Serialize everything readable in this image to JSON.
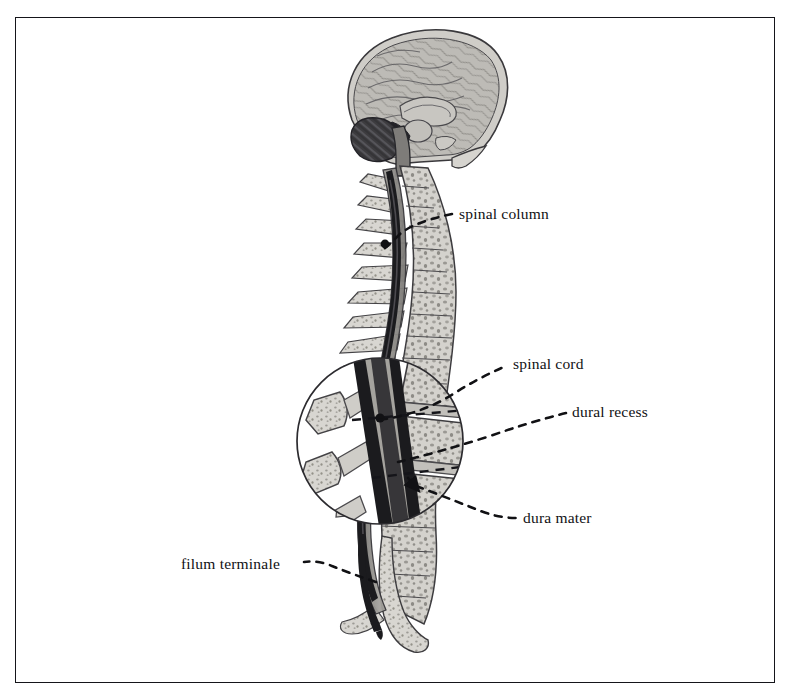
{
  "figure": {
    "domain_type": "anatomical-illustration",
    "style": "grayscale pen-and-wash medical illustration",
    "background_color": "#ffffff",
    "border_color": "#15151a",
    "ink_color": "#111114",
    "bone_fill": "#cfcdc8",
    "bone_light_fill": "#dedcd7",
    "cord_dark": "#1b1b1e",
    "dura_gray": "#8f8d89",
    "brain_fill": "#b9b7b2",
    "cerebellum_fill": "#3a393c"
  },
  "labels": [
    {
      "id": "spinal-column",
      "text": "spinal column",
      "x": 459,
      "y": 205,
      "anchor": "left"
    },
    {
      "id": "spinal-cord",
      "text": "spinal cord",
      "x": 513,
      "y": 355,
      "anchor": "left"
    },
    {
      "id": "dural-recess",
      "text": "dural recess",
      "x": 572,
      "y": 403,
      "anchor": "left"
    },
    {
      "id": "dura-mater",
      "text": "dura mater",
      "x": 523,
      "y": 509,
      "anchor": "left"
    },
    {
      "id": "filum-terminale",
      "text": "filum terminale",
      "x": 181,
      "y": 555,
      "anchor": "left"
    }
  ],
  "leaders": [
    {
      "id": "leader-spinal-column",
      "from": [
        385,
        244
      ],
      "to": [
        450,
        214
      ],
      "dash": "7,7"
    },
    {
      "id": "leader-spinal-cord",
      "from": [
        373,
        404
      ],
      "to": [
        505,
        364
      ],
      "dash": "7,7"
    },
    {
      "id": "leader-dural-recess",
      "from": [
        395,
        460
      ],
      "to": [
        565,
        412
      ],
      "dash": "7,7"
    },
    {
      "id": "leader-dura-mater",
      "from": [
        415,
        487
      ],
      "to": [
        515,
        518
      ],
      "dash": "7,7"
    },
    {
      "id": "leader-filum-terminale",
      "from": [
        377,
        580
      ],
      "to": [
        303,
        562
      ],
      "dash": "7,7"
    }
  ],
  "inset": {
    "id": "magnified-vertebrae-inset",
    "center_x": 380,
    "center_y": 441,
    "radius": 83,
    "description": "magnified circular view of lumbar vertebrae, intervertebral discs, dura mater and spinal cord"
  },
  "regions": [
    {
      "id": "brain-sagittal-section",
      "description": "mid-sagittal section of brain within skull"
    },
    {
      "id": "cervical-spine",
      "description": "cervical vertebrae and spinal cord"
    },
    {
      "id": "thoracic-spine",
      "description": "thoracic vertebrae with spinous processes"
    },
    {
      "id": "lumbar-spine",
      "description": "lumbar vertebrae shown magnified in inset"
    },
    {
      "id": "sacrum-coccyx",
      "description": "sacrum and coccyx with filum terminale"
    }
  ]
}
